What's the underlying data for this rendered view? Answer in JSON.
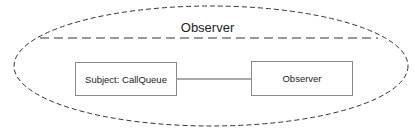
{
  "diagram": {
    "type": "uml-collaboration",
    "collaboration": {
      "name": "Observer",
      "shape": "dashed-ellipse"
    },
    "nodes": [
      {
        "id": "subject",
        "label": "Subject: CallQueue"
      },
      {
        "id": "observer",
        "label": "Observer"
      }
    ],
    "edges": [
      {
        "from": "subject",
        "to": "observer",
        "style": "solid"
      }
    ],
    "colors": {
      "stroke": "#333333",
      "box_border": "#8a8a8a",
      "background": "#ffffff"
    }
  }
}
